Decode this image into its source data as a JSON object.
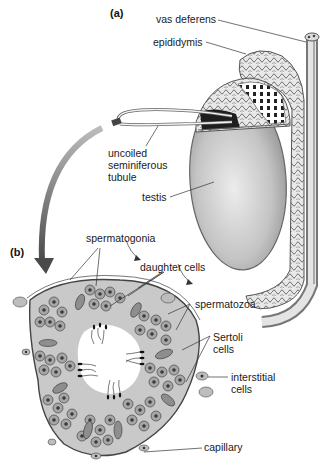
{
  "figure": {
    "panel_a": {
      "label": "(a)",
      "labels": {
        "vas_deferens": "vas deferens",
        "epididymis": "epididymis",
        "uncoiled_1": "uncoiled",
        "uncoiled_2": "seminiferous",
        "uncoiled_3": "tubule",
        "testis": "testis"
      }
    },
    "panel_b": {
      "label": "(b)",
      "labels": {
        "spermatogonia": "spermatogonia",
        "daughter_cells": "daughter cells",
        "spermatozoa": "spermatozoa",
        "sertoli_1": "Sertoli",
        "sertoli_2": "cells",
        "interstitial_1": "interstitial",
        "interstitial_2": "cells",
        "capillary": "capillary"
      }
    },
    "colors": {
      "tissue_fill": "#c8c8c8",
      "cell_fill": "#9a9a9a",
      "nucleus": "#3a3a3a",
      "lumen": "#ffffff",
      "arrow": "#555555",
      "testis_light": "#e2e2e2",
      "testis_dark": "#8e8e8e"
    }
  }
}
